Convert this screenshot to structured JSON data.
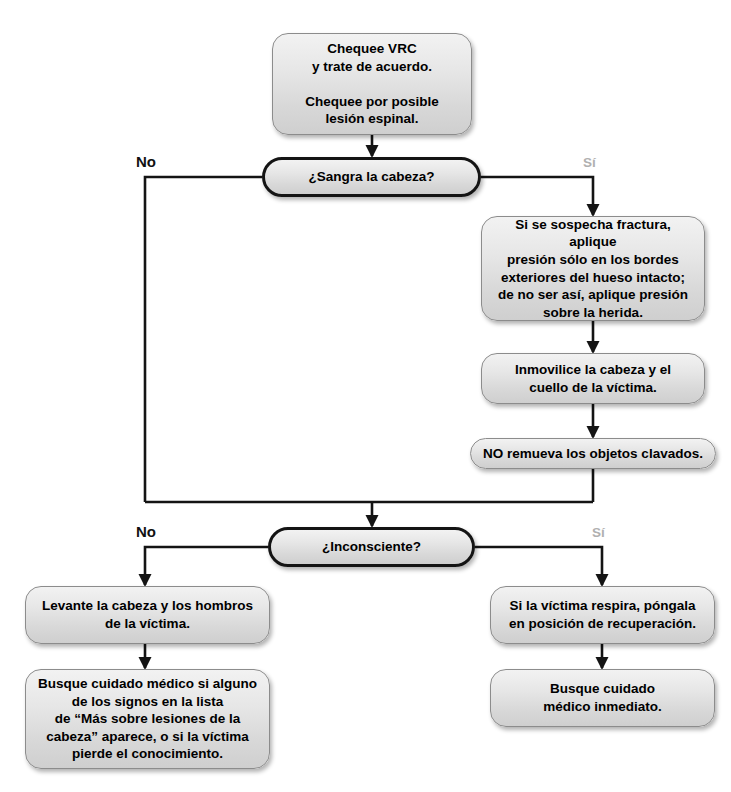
{
  "document": {
    "title": "Diagrama de flujo: lesiones en la cabeza",
    "background_color": "#ffffff",
    "node_fill_color": "#e6e6e6",
    "node_border_color": "#8c8c8c",
    "decision_border_color": "#141414",
    "connector_color": "#141414",
    "yes_label_color": "#b0b0b0",
    "no_label_color": "#111111"
  },
  "nodes": {
    "start": {
      "type": "process",
      "text": "Chequee VRC\ny trate de acuerdo.\n\nChequee por posible\nlesión espinal."
    },
    "decision_bleeding": {
      "type": "decision",
      "text": "¿Sangra la cabeza?"
    },
    "pressure": {
      "type": "process",
      "text": "Si se sospecha fractura, aplique\npresión sólo en los bordes\nexteriores del hueso intacto;\nde no ser así, aplique presión\nsobre la herida."
    },
    "immobilize": {
      "type": "process",
      "text": "Inmovilice la cabeza y el\ncuello de la víctima."
    },
    "no_remove": {
      "type": "process",
      "text": "NO remueva los objetos clavados."
    },
    "decision_unconscious": {
      "type": "decision",
      "text": "¿Inconsciente?"
    },
    "raise_head": {
      "type": "process",
      "text": "Levante la cabeza y los hombros\nde la víctima."
    },
    "seek_care_signs": {
      "type": "process",
      "text": "Busque cuidado médico si alguno\nde los signos  en la lista\nde “Más sobre lesiones  de la\ncabeza” aparece, o si la víctima\npierde el conocimiento."
    },
    "recovery_position": {
      "type": "process",
      "text": "Si la víctima respira, póngala\nen posición de recuperación."
    },
    "seek_care_now": {
      "type": "process",
      "text": "Busque cuidado\nmédico inmediato."
    }
  },
  "branch_labels": {
    "bleeding_no": "No",
    "bleeding_yes": "Sí",
    "unconscious_no": "No",
    "unconscious_yes": "Sí"
  }
}
